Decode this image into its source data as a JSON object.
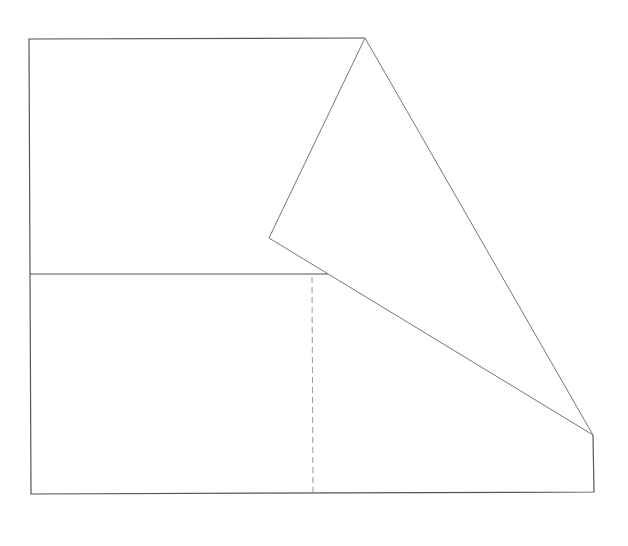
{
  "diagram": {
    "labels": []
  }
}
